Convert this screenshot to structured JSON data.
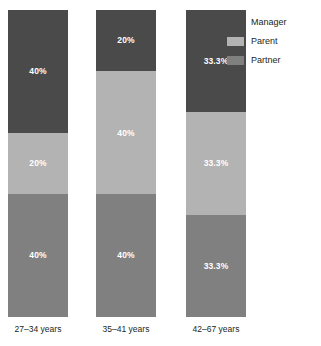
{
  "chart_data": {
    "type": "bar",
    "title": "",
    "subtitle": "",
    "xlabel": "",
    "ylabel": "",
    "ylim": [
      0,
      100
    ],
    "stacked": true,
    "normalized": true,
    "grid": false,
    "legend_position": "top-right",
    "categories": [
      "27–34 years",
      "35–41 years",
      "42–67 years"
    ],
    "series": [
      {
        "name": "Manager",
        "color": "#4a4a4a",
        "values": [
          40,
          20,
          33.3
        ],
        "labels": [
          "40%",
          "20%",
          "33.3%"
        ]
      },
      {
        "name": "Parent",
        "color": "#b3b3b3",
        "values": [
          20,
          40,
          33.3
        ],
        "labels": [
          "20%",
          "40%",
          "33.3%"
        ]
      },
      {
        "name": "Partner",
        "color": "#808080",
        "values": [
          40,
          40,
          33.3
        ],
        "labels": [
          "40%",
          "40%",
          "33.3%"
        ]
      }
    ]
  },
  "legend": {
    "items": [
      {
        "label": "Manager",
        "color": "#4a4a4a"
      },
      {
        "label": "Parent",
        "color": "#b3b3b3"
      },
      {
        "label": "Partner",
        "color": "#808080"
      }
    ]
  },
  "axis": {
    "category_labels": [
      "27–34 years",
      "35–41 years",
      "42–67 years"
    ]
  },
  "colors": {
    "manager": "#4a4a4a",
    "parent": "#b3b3b3",
    "partner": "#808080",
    "label_text": "#ffffff",
    "axis_text": "#231f20",
    "background": "#ffffff"
  }
}
